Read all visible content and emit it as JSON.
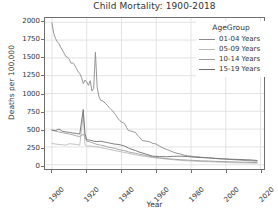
{
  "chart_data": {
    "type": "line",
    "title": "Child Mortality: 1900-2018",
    "xlabel": "Year",
    "ylabel": "Deaths per 100,000",
    "xlim": [
      1896,
      2022
    ],
    "ylim": [
      -60,
      2060
    ],
    "xticks": [
      1900,
      1920,
      1940,
      1960,
      1980,
      2000,
      2020
    ],
    "yticks": [
      0,
      250,
      500,
      750,
      1000,
      1250,
      1500,
      1750,
      2000
    ],
    "grid": true,
    "legend_position": "upper right",
    "legend_title": "AgeGroup",
    "series": [
      {
        "name": "01-04 Years",
        "color": "#8a8a8a",
        "x": [
          1900,
          1901,
          1902,
          1903,
          1904,
          1905,
          1906,
          1907,
          1908,
          1909,
          1910,
          1911,
          1912,
          1913,
          1914,
          1915,
          1916,
          1917,
          1918,
          1919,
          1920,
          1921,
          1922,
          1923,
          1924,
          1925,
          1926,
          1927,
          1928,
          1929,
          1930,
          1931,
          1932,
          1933,
          1934,
          1935,
          1936,
          1937,
          1938,
          1939,
          1940,
          1941,
          1942,
          1943,
          1944,
          1945,
          1946,
          1947,
          1948,
          1949,
          1950,
          1952,
          1954,
          1956,
          1958,
          1960,
          1962,
          1964,
          1966,
          1968,
          1970,
          1972,
          1974,
          1976,
          1978,
          1980,
          1982,
          1984,
          1986,
          1988,
          1990,
          1992,
          1994,
          1996,
          1998,
          2000,
          2002,
          2004,
          2006,
          2008,
          2010,
          2012,
          2014,
          2016,
          2018
        ],
        "values": [
          1990,
          1845,
          1775,
          1730,
          1700,
          1650,
          1610,
          1565,
          1520,
          1510,
          1480,
          1425,
          1430,
          1400,
          1355,
          1310,
          1280,
          1225,
          1140,
          1190,
          1160,
          1115,
          1180,
          1035,
          1070,
          1580,
          1090,
          960,
          905,
          900,
          880,
          855,
          830,
          800,
          775,
          755,
          720,
          690,
          650,
          620,
          600,
          590,
          570,
          520,
          480,
          475,
          470,
          460,
          455,
          420,
          395,
          340,
          330,
          325,
          300,
          290,
          260,
          235,
          215,
          195,
          175,
          160,
          150,
          135,
          125,
          120,
          115,
          110,
          105,
          100,
          95,
          90,
          87,
          84,
          82,
          80,
          76,
          72,
          68,
          65,
          62,
          58,
          55,
          53,
          50
        ]
      },
      {
        "name": "05-09 Years",
        "color": "#b9b9b9",
        "x": [
          1900,
          1902,
          1904,
          1906,
          1908,
          1910,
          1912,
          1914,
          1916,
          1918,
          1919,
          1920,
          1922,
          1924,
          1926,
          1928,
          1930,
          1932,
          1934,
          1936,
          1938,
          1940,
          1942,
          1944,
          1946,
          1948,
          1950,
          1954,
          1958,
          1962,
          1966,
          1970,
          1974,
          1978,
          1982,
          1986,
          1990,
          1994,
          1998,
          2002,
          2006,
          2010,
          2014,
          2018
        ],
        "values": [
          300,
          290,
          285,
          280,
          275,
          295,
          290,
          285,
          275,
          700,
          280,
          260,
          265,
          255,
          250,
          240,
          230,
          220,
          210,
          200,
          190,
          180,
          170,
          160,
          150,
          140,
          130,
          115,
          100,
          90,
          80,
          70,
          62,
          55,
          50,
          45,
          42,
          38,
          34,
          30,
          28,
          26,
          24,
          22
        ]
      },
      {
        "name": "10-14 Years",
        "color": "#9d9d9d",
        "x": [
          1900,
          1902,
          1904,
          1906,
          1908,
          1910,
          1912,
          1914,
          1916,
          1918,
          1919,
          1920,
          1922,
          1924,
          1926,
          1928,
          1930,
          1932,
          1934,
          1936,
          1938,
          1940,
          1942,
          1944,
          1946,
          1948,
          1950,
          1954,
          1958,
          1962,
          1966,
          1970,
          1974,
          1978,
          1982,
          1986,
          1990,
          1994,
          1998,
          2002,
          2006,
          2010,
          2014,
          2018
        ],
        "values": [
          490,
          470,
          460,
          450,
          440,
          430,
          420,
          405,
          395,
          430,
          390,
          330,
          320,
          300,
          285,
          275,
          265,
          250,
          240,
          230,
          215,
          205,
          195,
          180,
          170,
          160,
          150,
          130,
          110,
          95,
          85,
          78,
          70,
          65,
          60,
          55,
          52,
          48,
          45,
          42,
          38,
          35,
          33,
          30
        ]
      },
      {
        "name": "15-19 Years",
        "color": "#6e6e6e",
        "x": [
          1900,
          1902,
          1904,
          1906,
          1908,
          1910,
          1912,
          1914,
          1916,
          1918,
          1919,
          1920,
          1922,
          1924,
          1926,
          1928,
          1930,
          1932,
          1934,
          1936,
          1938,
          1940,
          1942,
          1944,
          1946,
          1948,
          1950,
          1954,
          1958,
          1962,
          1966,
          1970,
          1974,
          1978,
          1982,
          1986,
          1990,
          1994,
          1998,
          2002,
          2006,
          2010,
          2014,
          2018
        ],
        "values": [
          485,
          480,
          500,
          470,
          460,
          455,
          445,
          440,
          430,
          775,
          440,
          350,
          345,
          330,
          325,
          330,
          320,
          310,
          300,
          290,
          285,
          275,
          260,
          235,
          215,
          200,
          180,
          150,
          120,
          115,
          112,
          118,
          120,
          115,
          105,
          100,
          98,
          90,
          82,
          78,
          75,
          72,
          68,
          60
        ]
      }
    ]
  },
  "legend": {
    "title": "AgeGroup",
    "items": [
      {
        "label": "01-04 Years",
        "color": "#8a8a8a"
      },
      {
        "label": "05-09 Years",
        "color": "#b9b9b9"
      },
      {
        "label": "10-14 Years",
        "color": "#9d9d9d"
      },
      {
        "label": "15-19 Years",
        "color": "#6e6e6e"
      }
    ]
  },
  "axes": {
    "title": "Child Mortality: 1900-2018",
    "xlabel": "Year",
    "ylabel": "Deaths per 100,000",
    "ytick_labels": [
      "0",
      "250",
      "500",
      "750",
      "1000",
      "1250",
      "1500",
      "1750",
      "2000"
    ],
    "xtick_labels": [
      "1900",
      "1920",
      "1940",
      "1960",
      "1980",
      "2000",
      "2020"
    ]
  },
  "style": {
    "grid_color": "#e3e3e3",
    "axis_color": "#6f6f6f",
    "text_color": "#333333",
    "background": "#ffffff"
  }
}
